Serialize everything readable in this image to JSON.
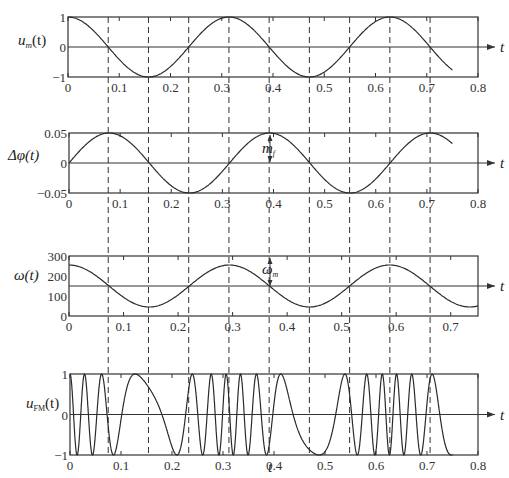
{
  "chart_data": [
    {
      "type": "line",
      "id": "um",
      "ylabel": "u_m(t)",
      "ylabel_main": "u",
      "ylabel_sub": "m",
      "ylabel_tail": "(t)",
      "xlabel_arrow": "t",
      "xlim": [
        0,
        0.8
      ],
      "ylim": [
        -1,
        1
      ],
      "xticks": [
        "0",
        "0.1",
        "0.2",
        "0.3",
        "0.4",
        "0.5",
        "0.6",
        "0.7",
        "0.8"
      ],
      "yticks": [
        "-1",
        "0",
        "1"
      ],
      "function": "cos(2*pi*t/0.314)",
      "t_end": 0.75,
      "grid": false
    },
    {
      "type": "line",
      "id": "dphi",
      "ylabel": "Δφ(t)",
      "xlabel_arrow": "t",
      "xlim": [
        0,
        0.8
      ],
      "ylim": [
        -0.05,
        0.05
      ],
      "xticks": [
        "0",
        "0.1",
        "0.2",
        "0.3",
        "0.4",
        "0.5",
        "0.6",
        "0.7",
        "0.8"
      ],
      "yticks": [
        "-0.05",
        "0",
        "0.05"
      ],
      "function": "0.05*sin(2*pi*t/0.314)",
      "t_end": 0.75,
      "annotation": "m_f",
      "annotation_main": "m",
      "annotation_sub": "f",
      "grid": false
    },
    {
      "type": "line",
      "id": "omega",
      "ylabel": "ω(t)",
      "xlabel_arrow": "t",
      "xlim": [
        0,
        0.75
      ],
      "ylim": [
        0,
        300
      ],
      "xticks": [
        "0",
        "0.1",
        "0.2",
        "0.3",
        "0.4",
        "0.5",
        "0.6",
        "0.7"
      ],
      "yticks": [
        "0",
        "100",
        "200",
        "300"
      ],
      "center": 150,
      "amplitude": 105,
      "period": 0.294,
      "t_end": 0.75,
      "annotation": "ω_m",
      "annotation_main": "ω",
      "annotation_sub": "m",
      "grid": false
    },
    {
      "type": "line",
      "id": "ufm",
      "ylabel": "u_FM(t)",
      "ylabel_main": "u",
      "ylabel_sub": "FM",
      "ylabel_tail": "(t)",
      "xlabel_arrow": "t",
      "xlabel": "t",
      "xlim": [
        0,
        0.8
      ],
      "ylim": [
        -1,
        1
      ],
      "xticks": [
        "0",
        "0.1",
        "0.2",
        "0.3",
        "0.4",
        "0.5",
        "0.6",
        "0.7",
        "0.8"
      ],
      "yticks": [
        "-1",
        "0",
        "1"
      ],
      "function": "cos(phase(t)), instantaneous frequency ∝ ω(t)",
      "t_end": 0.75,
      "grid": false
    }
  ],
  "dashed_lines_t": [
    0.0785,
    0.157,
    0.2355,
    0.314,
    0.3925,
    0.471,
    0.5495,
    0.628,
    0.7065
  ],
  "labels": {
    "p1_y": "u",
    "p1_sub": "m",
    "p1_tail": "(t)",
    "p2_y": "Δφ(t)",
    "p3_y": "ω(t)",
    "p4_y": "u",
    "p4_sub": "FM",
    "p4_tail": "(t)",
    "t": "t",
    "mf": "m",
    "mf_sub": "f",
    "wm": "ω",
    "wm_sub": "m"
  },
  "colors": {
    "line": "#2a2a2a",
    "axis": "#333333",
    "dash": "#333333"
  }
}
